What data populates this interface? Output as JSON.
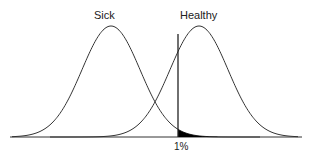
{
  "diagram": {
    "curves": [
      {
        "name": "Sick",
        "peak_x": 111
      },
      {
        "name": "Healthy",
        "peak_x": 199
      }
    ],
    "threshold_label": "1%",
    "labels": {
      "sick": "Sick",
      "healthy": "Healthy",
      "threshold": "1%"
    },
    "colors": {
      "line": "#333333",
      "fill": "#000000",
      "background": "#ffffff"
    }
  }
}
